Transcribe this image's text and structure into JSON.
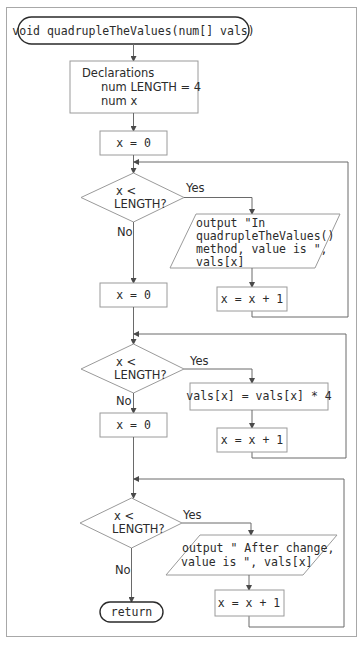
{
  "diagram": {
    "start": {
      "label": "void quadrupleTheValues(num[] vals)"
    },
    "declarations": {
      "title": "Declarations",
      "lines": [
        "num LENGTH = 4",
        "num x"
      ]
    },
    "init1": {
      "label": "x = 0"
    },
    "loop1": {
      "decision": {
        "line1": "x <",
        "line2": "LENGTH?"
      },
      "yes_label": "Yes",
      "no_label": "No",
      "output": {
        "lines": [
          "output \"In",
          "quadrupleTheValues()",
          "method, value is \",",
          "vals[x]"
        ]
      },
      "increment": {
        "label": "x = x + 1"
      }
    },
    "init2": {
      "label": "x = 0"
    },
    "loop2": {
      "decision": {
        "line1": "x <",
        "line2": "LENGTH?"
      },
      "yes_label": "Yes",
      "no_label": "No",
      "process": {
        "label": "vals[x] = vals[x] * 4"
      },
      "increment": {
        "label": "x = x + 1"
      }
    },
    "init3": {
      "label": "x = 0"
    },
    "loop3": {
      "decision": {
        "line1": "x <",
        "line2": "LENGTH?"
      },
      "yes_label": "Yes",
      "no_label": "No",
      "output": {
        "lines": [
          "output \" After change,",
          "value is \", vals[x]"
        ]
      },
      "increment": {
        "label": "x = x + 1"
      }
    },
    "end": {
      "label": "return"
    }
  }
}
